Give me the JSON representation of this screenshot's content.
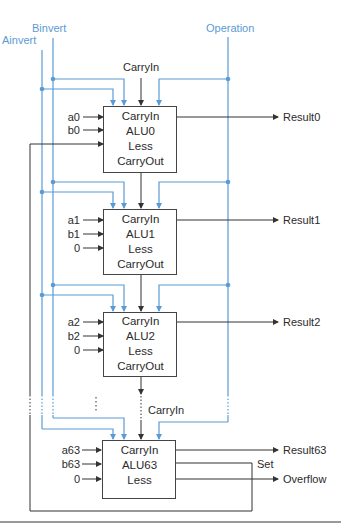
{
  "control_signals": {
    "ainvert": "Ainvert",
    "binvert": "Binvert",
    "operation": "Operation",
    "carryin_top": "CarryIn",
    "carryin_last": "CarryIn"
  },
  "alus": [
    {
      "name": "ALU0",
      "ports": [
        "CarryIn",
        "ALU0",
        "Less",
        "CarryOut"
      ],
      "inputs": [
        "a0",
        "b0"
      ],
      "result": "Result0"
    },
    {
      "name": "ALU1",
      "ports": [
        "CarryIn",
        "ALU1",
        "Less",
        "CarryOut"
      ],
      "inputs": [
        "a1",
        "b1",
        "0"
      ],
      "result": "Result1"
    },
    {
      "name": "ALU2",
      "ports": [
        "CarryIn",
        "ALU2",
        "Less",
        "CarryOut"
      ],
      "inputs": [
        "a2",
        "b2",
        "0"
      ],
      "result": "Result2"
    },
    {
      "name": "ALU63",
      "ports": [
        "CarryIn",
        "ALU63",
        "Less"
      ],
      "inputs": [
        "a63",
        "b63",
        "0"
      ],
      "result": "Result63"
    }
  ],
  "outputs": {
    "set": "Set",
    "overflow": "Overflow"
  },
  "colors": {
    "control_line": "#5b9bd5",
    "data_line": "#333333"
  }
}
